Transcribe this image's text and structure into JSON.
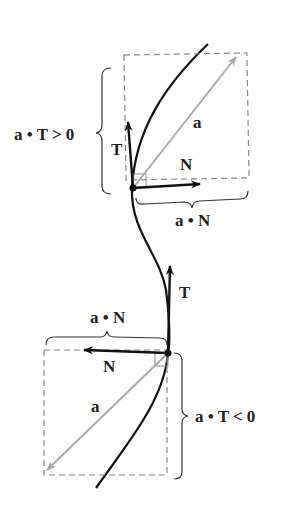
{
  "diagram": {
    "top_point": {
      "tangent_label": "T",
      "normal_label": "N",
      "accel_label": "a",
      "tangential_component_label": "a • T > 0",
      "normal_component_label": "a • N"
    },
    "bottom_point": {
      "tangent_label": "T",
      "normal_label": "N",
      "accel_label": "a",
      "tangential_component_label": "a • T < 0",
      "normal_component_label": "a • N"
    },
    "colors": {
      "curve": "#111111",
      "accel_vector": "#aaaaaa",
      "dashed_box": "#888888",
      "unit_vectors": "#111111"
    }
  }
}
